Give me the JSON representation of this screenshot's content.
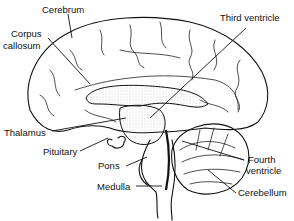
{
  "diagram": {
    "labels": [
      {
        "id": "cerebrum",
        "text": "Cerebrum"
      },
      {
        "id": "corpus-callosum-line1",
        "text": "Corpus"
      },
      {
        "id": "corpus-callosum-line2",
        "text": "callosum"
      },
      {
        "id": "third-ventricle",
        "text": "Third ventricle"
      },
      {
        "id": "thalamus",
        "text": "Thalamus"
      },
      {
        "id": "pituitary",
        "text": "Pituitary"
      },
      {
        "id": "pons",
        "text": "Pons"
      },
      {
        "id": "medulla",
        "text": "Medulla"
      },
      {
        "id": "fourth-ventricle-line1",
        "text": "Fourth"
      },
      {
        "id": "fourth-ventricle-line2",
        "text": "ventricle"
      },
      {
        "id": "cerebellum",
        "text": "Cerebellum"
      }
    ],
    "colors": {
      "ink": "#111111",
      "background": "#ffffff",
      "stipple": "#bbbbbb"
    }
  }
}
